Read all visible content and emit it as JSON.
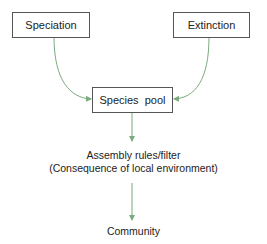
{
  "diagram": {
    "nodes": {
      "speciation": "Speciation",
      "extinction": "Extinction",
      "species_pool": "Species  pool",
      "assembly_line1": "Assembly rules/filter",
      "assembly_line2": "(Consequence of local environment)",
      "community": "Community"
    },
    "edges": [
      {
        "from": "speciation",
        "to": "species_pool"
      },
      {
        "from": "extinction",
        "to": "species_pool"
      },
      {
        "from": "species_pool",
        "to": "assembly_rules"
      },
      {
        "from": "assembly_rules",
        "to": "community"
      }
    ],
    "colors": {
      "arrow": "#7aaa7e",
      "box_border": "#555555"
    }
  }
}
